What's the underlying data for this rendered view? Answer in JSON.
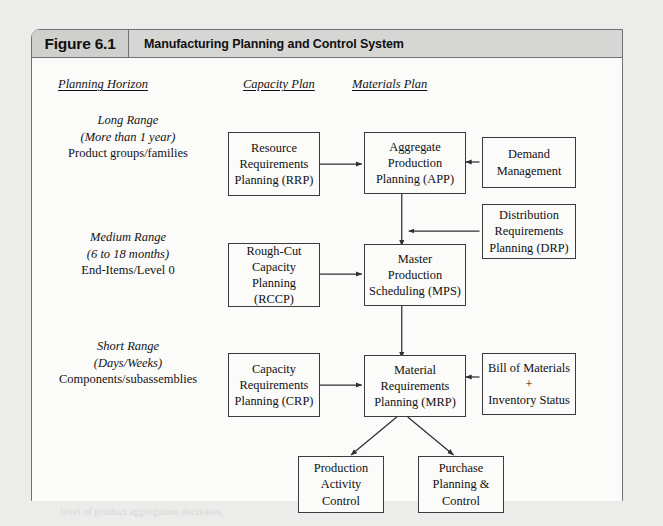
{
  "page": {
    "background_color": "#ececeb",
    "frame_border_color": "#6f7175"
  },
  "figure": {
    "number": "Figure 6.1",
    "title": "Manufacturing Planning and Control System",
    "header_bg": "#d6d6d4",
    "number_cell_bg": "#cfcfcd"
  },
  "columns": [
    {
      "key": "planning_horizon",
      "label": "Planning Horizon"
    },
    {
      "key": "capacity_plan",
      "label": "Capacity Plan"
    },
    {
      "key": "materials_plan",
      "label": "Materials Plan"
    }
  ],
  "rows": [
    {
      "key": "long_range",
      "range": "Long Range",
      "timeframe": "(More than 1 year)",
      "detail": "Product groups/families"
    },
    {
      "key": "medium_range",
      "range": "Medium Range",
      "timeframe": "(6 to 18 months)",
      "detail": "End-Items/Level 0"
    },
    {
      "key": "short_range",
      "range": "Short Range",
      "timeframe": "(Days/Weeks)",
      "detail": "Components/subassemblies"
    }
  ],
  "nodes": {
    "rrp": {
      "lines": [
        "Resource",
        "Requirements",
        "Planning (RRP)"
      ]
    },
    "app": {
      "lines": [
        "Aggregate",
        "Production",
        "Planning (APP)"
      ]
    },
    "demand": {
      "lines": [
        "Demand",
        "Management"
      ]
    },
    "drp": {
      "lines": [
        "Distribution",
        "Requirements",
        "Planning (DRP)"
      ]
    },
    "rccp": {
      "lines": [
        "Rough-Cut",
        "Capacity",
        "Planning (RCCP)"
      ]
    },
    "mps": {
      "lines": [
        "Master",
        "Production",
        "Scheduling (MPS)"
      ]
    },
    "crp": {
      "lines": [
        "Capacity",
        "Requirements",
        "Planning (CRP)"
      ]
    },
    "mrp": {
      "lines": [
        "Material",
        "Requirements",
        "Planning (MRP)"
      ]
    },
    "bom": {
      "lines": [
        "Bill of Materials",
        "+",
        "Inventory Status"
      ]
    },
    "pac": {
      "lines": [
        "Production",
        "Activity",
        "Control"
      ]
    },
    "ppc": {
      "lines": [
        "Purchase",
        "Planning &",
        "Control"
      ]
    }
  },
  "connections": [
    {
      "from": "rrp",
      "to": "app",
      "type": "bidirectional"
    },
    {
      "from": "demand",
      "to": "app",
      "type": "directed"
    },
    {
      "from": "app",
      "to": "mps",
      "type": "directed"
    },
    {
      "from": "drp",
      "to": "mps",
      "type": "directed"
    },
    {
      "from": "rccp",
      "to": "mps",
      "type": "bidirectional"
    },
    {
      "from": "mps",
      "to": "mrp",
      "type": "directed"
    },
    {
      "from": "crp",
      "to": "mrp",
      "type": "bidirectional"
    },
    {
      "from": "bom",
      "to": "mrp",
      "type": "directed"
    },
    {
      "from": "mrp",
      "to": "pac",
      "type": "directed"
    },
    {
      "from": "mrp",
      "to": "ppc",
      "type": "directed"
    }
  ],
  "background_text": {
    "note": "faint show-through text from the reverse of the printed page",
    "heading": "Operations Planning",
    "lines": [
      "an advanced stage of production scheduling and",
      "the capacity requirements are reconciled with the",
      "available resources over the planning horizon.",
      "to capacity planning at each level of the system",
      "and the master production schedule is then",
      "converted into detailed material requirements.",
      "production activity control and purchasing are",
      "the final execution stages of the system where",
      "shop floor orders and purchase orders are",
      "released, monitored and controlled over time.",
      "each planning level operates on a different time",
      "horizon with progressively greater detail as the",
      "planning horizon becomes shorter and the",
      "level of product aggregation decreases."
    ]
  }
}
